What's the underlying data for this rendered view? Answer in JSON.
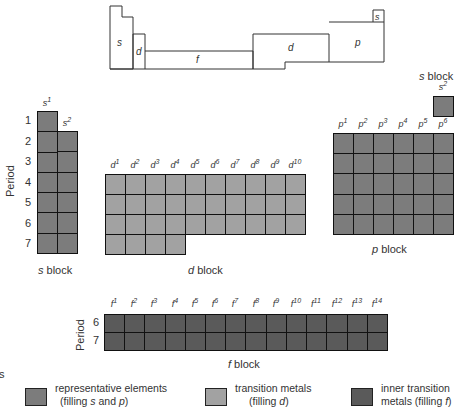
{
  "schematic": {
    "regions": [
      {
        "id": "s_left",
        "label": "s"
      },
      {
        "id": "d_narrow",
        "label": "d"
      },
      {
        "id": "f",
        "label": "f"
      },
      {
        "id": "d_right",
        "label": "d"
      },
      {
        "id": "p",
        "label": "p"
      },
      {
        "id": "s_he",
        "label": "s"
      }
    ]
  },
  "s_block": {
    "headers": [
      "s",
      "s"
    ],
    "header_sups": [
      "1",
      "2"
    ],
    "rows": [
      "1",
      "2",
      "3",
      "4",
      "5",
      "6",
      "7"
    ],
    "axis_label": "Period",
    "label_italic": "s",
    "label_text": " block"
  },
  "he_block": {
    "label_italic": "s",
    "label_text": " block",
    "header": "s",
    "header_sup": "2"
  },
  "d_block": {
    "headers": [
      "d",
      "d",
      "d",
      "d",
      "d",
      "d",
      "d",
      "d",
      "d",
      "d"
    ],
    "header_sups": [
      "1",
      "2",
      "3",
      "4",
      "5",
      "6",
      "7",
      "8",
      "9",
      "10"
    ],
    "label_italic": "d",
    "label_text": " block"
  },
  "p_block": {
    "headers": [
      "p",
      "p",
      "p",
      "p",
      "p",
      "p"
    ],
    "header_sups": [
      "1",
      "2",
      "3",
      "4",
      "5",
      "6"
    ],
    "label_italic": "p",
    "label_text": " block"
  },
  "f_block": {
    "headers": [
      "f",
      "f",
      "f",
      "f",
      "f",
      "f",
      "f",
      "f",
      "f",
      "f",
      "f",
      "f",
      "f",
      "f"
    ],
    "header_sups": [
      "1",
      "2",
      "3",
      "4",
      "5",
      "6",
      "7",
      "8",
      "9",
      "10",
      "11",
      "12",
      "13",
      "14"
    ],
    "rows": [
      "6",
      "7"
    ],
    "axis_label": "Period",
    "label_italic": "f",
    "label_text": " block"
  },
  "legend": {
    "cut_text": "s",
    "items": [
      {
        "line1": "representative elements",
        "line2_pre": "(filling ",
        "line2_it1": "s",
        "line2_mid": " and ",
        "line2_it2": "p",
        "line2_post": ")",
        "color": "#7c7c7c"
      },
      {
        "line1": "transition metals",
        "line2_pre": "(filling ",
        "line2_it1": "d",
        "line2_mid": "",
        "line2_it2": "",
        "line2_post": ")",
        "color": "#a2a2a2"
      },
      {
        "line1": "inner transition",
        "line2_pre": "metals (filling ",
        "line2_it1": "f",
        "line2_mid": "",
        "line2_it2": "",
        "line2_post": ")",
        "color": "#5a5a5a"
      }
    ]
  },
  "colors": {
    "representative": "#7c7c7c",
    "transition": "#a2a2a2",
    "inner_transition": "#5a5a5a",
    "grid_lines": "#111111"
  }
}
